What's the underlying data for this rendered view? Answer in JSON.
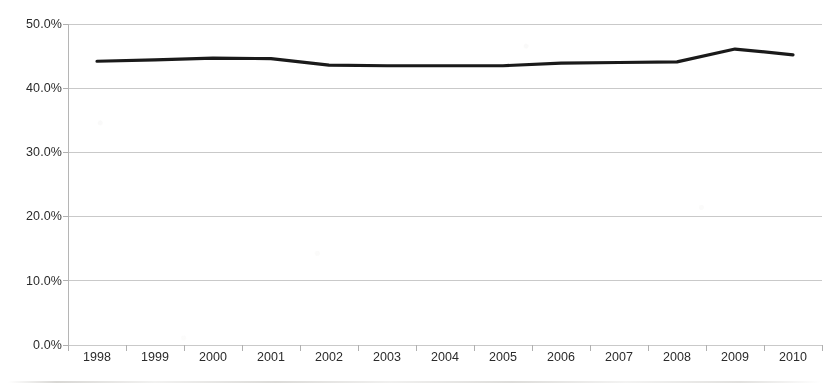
{
  "chart_data": {
    "type": "line",
    "title": "",
    "subtitle": "",
    "xlabel": "",
    "ylabel": "",
    "categories": [
      "1998",
      "1999",
      "2000",
      "2001",
      "2002",
      "2003",
      "2004",
      "2005",
      "2006",
      "2007",
      "2008",
      "2009",
      "2010"
    ],
    "values": [
      44.2,
      44.4,
      44.7,
      44.6,
      43.6,
      43.5,
      43.5,
      43.5,
      43.9,
      44.0,
      44.1,
      46.1,
      45.2
    ],
    "series": [
      {
        "name": "",
        "values": [
          44.2,
          44.4,
          44.7,
          44.6,
          43.6,
          43.5,
          43.5,
          43.5,
          43.9,
          44.0,
          44.1,
          46.1,
          45.2
        ],
        "color": "#1a1a1a",
        "line_width": 3.2,
        "markers": false
      }
    ],
    "ylim": [
      0,
      50
    ],
    "ytick_values": [
      0,
      10,
      20,
      30,
      40,
      50
    ],
    "ytick_labels": [
      "0.0%",
      "10.0%",
      "20.0%",
      "30.0%",
      "40.0%",
      "50.0%"
    ],
    "y_tick_format": "percent_one_decimal",
    "grid": {
      "horizontal": true,
      "vertical": false,
      "color": "#c9c9c9"
    },
    "legend": {
      "visible": false,
      "position": "none",
      "entries": []
    },
    "axes": {
      "y_axis_line_color": "#b5b5b5",
      "x_axis_line_color": "#b5b5b5",
      "tick_marks": true,
      "tick_mark_color": "#b0b0b0"
    },
    "plot_area": {
      "left": 68,
      "top": 24,
      "right": 822,
      "bottom": 345
    },
    "background_color": "#ffffff"
  },
  "annotations": {
    "none": ""
  }
}
